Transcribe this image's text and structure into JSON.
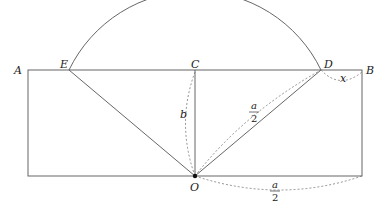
{
  "diagram": {
    "points": {
      "A": "A",
      "B": "B",
      "C": "C",
      "D": "D",
      "E": "E",
      "O": "O"
    },
    "labels": {
      "b": "b",
      "x": "x",
      "half_a_num_1": "a",
      "half_a_den_1": "2",
      "half_a_num_2": "a",
      "half_a_den_2": "2"
    },
    "colors": {
      "line": "#555555",
      "dashed": "#777777",
      "point": "#111111"
    }
  }
}
